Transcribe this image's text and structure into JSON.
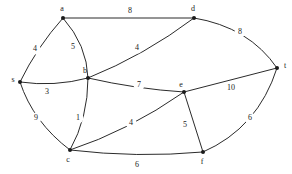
{
  "figure": {
    "kind": "weighted-undirected-graph",
    "background_color": "#ffffff",
    "edge_color": "#2b2b2b",
    "node_color": "#1a1a1a",
    "label_color": "#1a1a1a"
  },
  "nodes": [
    {
      "id": "s",
      "label": "s",
      "x": 20,
      "y": 82,
      "label_x": 13,
      "label_y": 80
    },
    {
      "id": "a",
      "label": "a",
      "x": 63,
      "y": 18,
      "label_x": 62,
      "label_y": 9
    },
    {
      "id": "b",
      "label": "b",
      "x": 88,
      "y": 78,
      "label_x": 85,
      "label_y": 71
    },
    {
      "id": "c",
      "label": "c",
      "x": 70,
      "y": 150,
      "label_x": 68,
      "label_y": 160
    },
    {
      "id": "d",
      "label": "d",
      "x": 194,
      "y": 18,
      "label_x": 193,
      "label_y": 9
    },
    {
      "id": "e",
      "label": "e",
      "x": 184,
      "y": 92,
      "label_x": 181,
      "label_y": 85
    },
    {
      "id": "f",
      "label": "f",
      "x": 203,
      "y": 152,
      "label_x": 202,
      "label_y": 162
    },
    {
      "id": "t",
      "label": "t",
      "x": 277,
      "y": 68,
      "label_x": 285,
      "label_y": 66
    }
  ],
  "edges": [
    {
      "from": "s",
      "to": "a",
      "weight": "4",
      "path": "M 20 82 Q 37 47 63 18",
      "label_x": 35,
      "label_y": 49
    },
    {
      "from": "s",
      "to": "b",
      "weight": "3",
      "path": "M 20 82 Q 54 87 88 78",
      "label_x": 47,
      "label_y": 92
    },
    {
      "from": "s",
      "to": "c",
      "weight": "9",
      "path": "M 20 82 Q 33 122 70 150",
      "label_x": 36,
      "label_y": 118
    },
    {
      "from": "a",
      "to": "b",
      "weight": "5",
      "path": "M 63 18 Q 87 45 88 78",
      "label_x": 73,
      "label_y": 47
    },
    {
      "from": "a",
      "to": "d",
      "weight": "8",
      "path": "M 63 18 L 194 18",
      "label_x": 130,
      "label_y": 11
    },
    {
      "from": "b",
      "to": "d",
      "weight": "4",
      "path": "M 88 78 Q 145 55 194 18",
      "label_x": 137,
      "label_y": 48
    },
    {
      "from": "b",
      "to": "c",
      "weight": "1",
      "path": "M 88 78 Q 88 118 70 150",
      "label_x": 78,
      "label_y": 118
    },
    {
      "from": "b",
      "to": "e",
      "weight": "7",
      "path": "M 88 78 Q 136 89 184 92",
      "label_x": 139,
      "label_y": 85
    },
    {
      "from": "c",
      "to": "e",
      "weight": "4",
      "path": "M 70 150 Q 128 131 184 92",
      "label_x": 131,
      "label_y": 123
    },
    {
      "from": "c",
      "to": "f",
      "weight": "6",
      "path": "M 70 150 Q 137 158 203 152",
      "label_x": 137,
      "label_y": 165
    },
    {
      "from": "e",
      "to": "f",
      "weight": "5",
      "path": "M 184 92 L 203 152",
      "label_x": 185,
      "label_y": 125
    },
    {
      "from": "e",
      "to": "t",
      "weight": "10",
      "path": "M 184 92 L 277 68",
      "label_x": 231,
      "label_y": 88
    },
    {
      "from": "d",
      "to": "t",
      "weight": "8",
      "path": "M 194 18 Q 249 27 277 68",
      "label_x": 240,
      "label_y": 32
    },
    {
      "from": "f",
      "to": "t",
      "weight": "6",
      "path": "M 203 152 Q 258 128 277 68",
      "label_x": 250,
      "label_y": 118
    }
  ]
}
